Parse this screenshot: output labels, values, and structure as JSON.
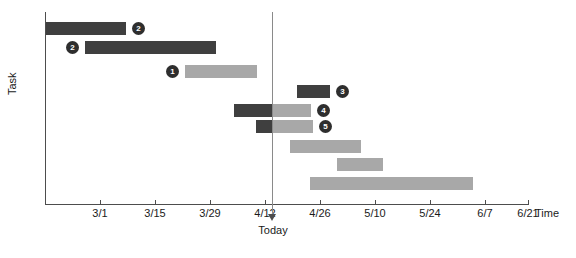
{
  "chart_data": {
    "type": "bar",
    "chart_kind": "gantt",
    "title": "",
    "xlabel": "Time",
    "ylabel": "Task",
    "grid": false,
    "legend": null,
    "x_axis": {
      "tick_labels": [
        "3/1",
        "3/15",
        "3/29",
        "4/12",
        "4/26",
        "5/10",
        "5/24",
        "6/7",
        "6/21"
      ],
      "tick_x_px": [
        100,
        155,
        210,
        265,
        320,
        375,
        430,
        485,
        528
      ],
      "range_start_label": "2/22",
      "range_end_label": "6/21"
    },
    "y_axis": {
      "label": "Task",
      "tick_labels": []
    },
    "today_marker": {
      "label": "Today",
      "x_px": 272,
      "approx_date": "4/22"
    },
    "colors": {
      "bar_done": "#3f3f3f",
      "bar_todo": "#a8a8a8",
      "marker_fill": "#2e2e2e",
      "marker_text": "#ffffff",
      "axis": "#4d4d4d",
      "today_line": "#8a8a8a",
      "background": "#ffffff"
    },
    "tasks": [
      {
        "id": 1,
        "start_px": 46,
        "end_px": 126,
        "top_px": 22,
        "progress_px": 80,
        "style": "done",
        "marker": "2",
        "marker_side": "right"
      },
      {
        "id": 2,
        "start_px": 85,
        "end_px": 216,
        "top_px": 41,
        "progress_px": 131,
        "style": "done",
        "marker": "2",
        "marker_side": "left"
      },
      {
        "id": 3,
        "start_px": 185,
        "end_px": 257,
        "top_px": 65,
        "progress_px": 0,
        "style": "todo",
        "marker": "1",
        "marker_side": "left"
      },
      {
        "id": 4,
        "start_px": 297,
        "end_px": 330,
        "top_px": 85,
        "progress_px": 33,
        "style": "done",
        "marker": "3",
        "marker_side": "right"
      },
      {
        "id": 5,
        "start_px": 234,
        "end_px": 311,
        "top_px": 104,
        "progress_px": 39,
        "style": "split",
        "marker": "4",
        "marker_side": "right"
      },
      {
        "id": 6,
        "start_px": 256,
        "end_px": 313,
        "top_px": 120,
        "progress_px": 17,
        "style": "split",
        "marker": "5",
        "marker_side": "right"
      },
      {
        "id": 7,
        "start_px": 290,
        "end_px": 361,
        "top_px": 140,
        "progress_px": 0,
        "style": "todo",
        "marker": "",
        "marker_side": "none"
      },
      {
        "id": 8,
        "start_px": 337,
        "end_px": 383,
        "top_px": 158,
        "progress_px": 0,
        "style": "todo",
        "marker": "",
        "marker_side": "none"
      },
      {
        "id": 9,
        "start_px": 310,
        "end_px": 473,
        "top_px": 177,
        "progress_px": 0,
        "style": "todo",
        "marker": "",
        "marker_side": "none"
      }
    ]
  }
}
